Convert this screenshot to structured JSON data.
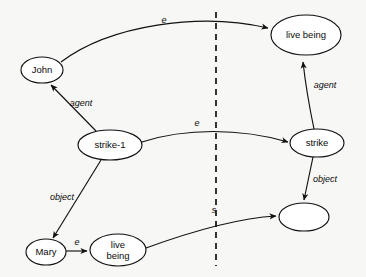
{
  "diagram": {
    "background_color": "#f7f7f5",
    "stroke_color": "#111111",
    "nodes": [
      {
        "id": "john",
        "label": "John",
        "cx": 42,
        "cy": 70,
        "rx": 21,
        "ry": 13,
        "side": "left"
      },
      {
        "id": "strike1",
        "label": "strike-1",
        "cx": 110,
        "cy": 145,
        "rx": 32,
        "ry": 15,
        "side": "left"
      },
      {
        "id": "mary",
        "label": "Mary",
        "cx": 46,
        "cy": 252,
        "rx": 20,
        "ry": 13,
        "side": "left"
      },
      {
        "id": "live-being-low",
        "label": "live being",
        "cx": 118,
        "cy": 250,
        "rx": 28,
        "ry": 16,
        "side": "left",
        "two_line": true
      },
      {
        "id": "live-being-top",
        "label": "live being",
        "cx": 306,
        "cy": 35,
        "rx": 35,
        "ry": 20,
        "side": "right"
      },
      {
        "id": "strike",
        "label": "strike",
        "cx": 317,
        "cy": 143,
        "rx": 27,
        "ry": 14,
        "side": "right"
      },
      {
        "id": "empty-node",
        "label": "",
        "cx": 304,
        "cy": 217,
        "rx": 25,
        "ry": 14,
        "side": "right"
      }
    ],
    "edges": [
      {
        "id": "john-e-livebeing",
        "label": "e",
        "from": "john",
        "to": "live-being-top",
        "label_x": 164,
        "label_y": 21
      },
      {
        "id": "strike1-agent-john",
        "label": "agent",
        "from": "strike1",
        "to": "john",
        "label_x": 81,
        "label_y": 104
      },
      {
        "id": "strike1-e-strike",
        "label": "e",
        "from": "strike1",
        "to": "strike",
        "label_x": 197,
        "label_y": 124
      },
      {
        "id": "strike1-object-mary",
        "label": "object",
        "from": "strike1",
        "to": "mary",
        "label_x": 62,
        "label_y": 198
      },
      {
        "id": "mary-e-livebeing",
        "label": "e",
        "from": "mary",
        "to": "live-being-low",
        "label_x": 77,
        "label_y": 244
      },
      {
        "id": "strike-agent-livebeing",
        "label": "agent",
        "from": "strike",
        "to": "live-being-top",
        "label_x": 325,
        "label_y": 86
      },
      {
        "id": "strike-object-empty",
        "label": "object",
        "from": "strike",
        "to": "empty-node",
        "label_x": 325,
        "label_y": 180
      },
      {
        "id": "livebeing-s-empty",
        "label": "s",
        "from": "live-being-low",
        "to": "empty-node",
        "label_x": 214,
        "label_y": 212
      }
    ],
    "divider": {
      "id": "instance-type-divider",
      "x": 216,
      "y1": 12,
      "y2": 266,
      "style": "dashed"
    }
  }
}
